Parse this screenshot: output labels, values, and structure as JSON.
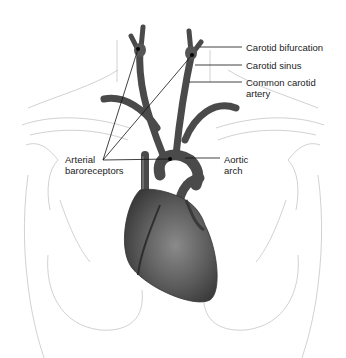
{
  "diagram": {
    "labels": {
      "carotid_bifurcation": "Carotid bifurcation",
      "carotid_sinus": "Carotid sinus",
      "common_carotid_line1": "Common carotid",
      "common_carotid_line2": "artery",
      "arterial_line1": "Arterial",
      "arterial_line2": "baroreceptors",
      "aortic_line1": "Aortic",
      "aortic_line2": "arch"
    },
    "colors": {
      "background": "#ffffff",
      "body_outline": "#bdbdbd",
      "vessel": "#4a4a4a",
      "heart": "#5a5a5a",
      "leader_line": "#111111",
      "text": "#222222"
    }
  }
}
